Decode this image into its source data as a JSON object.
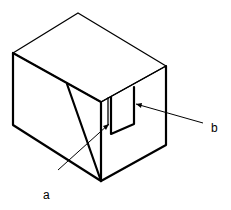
{
  "diagram": {
    "type": "isometric box with slot",
    "labels": {
      "a": "a",
      "b": "b"
    },
    "colors": {
      "line": "#000000",
      "background": "#ffffff"
    }
  }
}
